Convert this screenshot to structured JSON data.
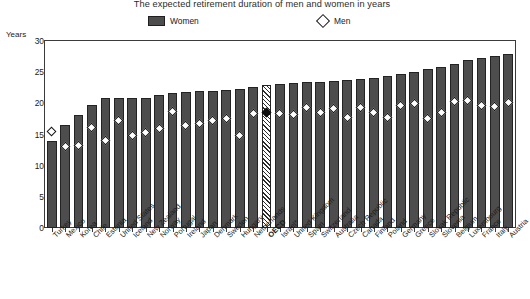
{
  "chart_data": {
    "type": "bar",
    "title": "The expected retirement duration of men and women in years",
    "xlabel": "",
    "ylabel": "Years",
    "ylim": [
      0,
      30
    ],
    "yticks": [
      0,
      5,
      10,
      15,
      20,
      25,
      30
    ],
    "grid": false,
    "legend_position": "top-center",
    "legend": [
      {
        "name": "Women",
        "marker": "filled-gray-bar"
      },
      {
        "name": "Men",
        "marker": "open-diamond"
      }
    ],
    "highlight_category": "OECD",
    "categories": [
      "Turkey",
      "Mexico",
      "Korea",
      "Chile",
      "Estonia",
      "United States",
      "Iceland",
      "New Zealand",
      "Norway",
      "Portugal",
      "Ireland",
      "Japan",
      "Denmark",
      "Sweden",
      "Hungary",
      "Netherlands",
      "OECD",
      "Israel*",
      "United Kingdom",
      "Spain",
      "Switzerland",
      "Australia",
      "Czech Republic",
      "Canada",
      "Finland",
      "Poland",
      "Germany",
      "Greece",
      "Slovak Republic",
      "Slovenia",
      "Belgium",
      "Luxembourg",
      "France",
      "Italy",
      "Austria"
    ],
    "series": [
      {
        "name": "Women",
        "values": [
          14.0,
          16.5,
          18.2,
          19.8,
          20.8,
          20.9,
          20.9,
          20.9,
          21.3,
          21.6,
          21.8,
          22.0,
          22.0,
          22.2,
          22.3,
          22.6,
          22.9,
          23.1,
          23.2,
          23.4,
          23.5,
          23.6,
          23.8,
          23.9,
          24.1,
          24.4,
          24.7,
          25.1,
          25.5,
          25.8,
          26.3,
          26.9,
          27.2,
          27.6,
          27.9
        ]
      },
      {
        "name": "Men",
        "values": [
          15.5,
          13.0,
          13.2,
          16.1,
          14.1,
          17.2,
          14.9,
          15.4,
          15.9,
          18.7,
          16.4,
          16.8,
          17.3,
          17.6,
          14.9,
          18.3,
          18.5,
          18.4,
          18.2,
          19.3,
          18.6,
          19.2,
          17.8,
          19.4,
          18.5,
          17.8,
          19.7,
          19.9,
          17.5,
          18.6,
          20.3,
          20.4,
          19.6,
          19.5,
          20.2
        ]
      }
    ]
  },
  "footnote": ""
}
